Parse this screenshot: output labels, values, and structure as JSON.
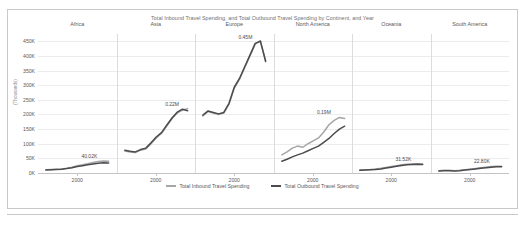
{
  "chart_data": {
    "type": "line",
    "title": "Total Inbound Travel Spending, and Total Outbound Travel Spending by Continent, and Year",
    "xlabel": "",
    "ylabel": "(Thousands)",
    "ylim": [
      0,
      475
    ],
    "yticks": [
      "0K",
      "50K",
      "100K",
      "150K",
      "200K",
      "250K",
      "300K",
      "350K",
      "400K",
      "450K"
    ],
    "ytick_values": [
      0,
      50,
      100,
      150,
      200,
      250,
      300,
      350,
      400,
      450
    ],
    "grid": true,
    "legend_position": "bottom",
    "facet_by": "Continent",
    "x_tick_label": "2000",
    "legend": [
      {
        "name": "Total Inbound Travel Spending",
        "color": "#a6a6a9"
      },
      {
        "name": "Total Outbound Travel Spending",
        "color": "#4c4c4f"
      }
    ],
    "panels": [
      {
        "name": "Africa",
        "data_label": "40.02K",
        "x": [
          1995,
          1997,
          1999,
          2001,
          2003,
          2005,
          2007,
          2009,
          2011,
          2013,
          2015,
          2017,
          2019
        ],
        "series": [
          {
            "name": "Total Inbound Travel Spending",
            "values": [
              11,
              12,
              13,
              14,
              16,
              20,
              25,
              28,
              32,
              36,
              39,
              41,
              40
            ]
          },
          {
            "name": "Total Outbound Travel Spending",
            "values": [
              10,
              11,
              12,
              13,
              15,
              18,
              22,
              25,
              28,
              31,
              33,
              35,
              34
            ]
          }
        ]
      },
      {
        "name": "Asia",
        "data_label": "0.22M",
        "x": [
          1995,
          1997,
          1999,
          2001,
          2003,
          2005,
          2007,
          2009,
          2011,
          2013,
          2015,
          2017,
          2019
        ],
        "series": [
          {
            "name": "Total Inbound Travel Spending",
            "values": [
              75,
              72,
              70,
              78,
              82,
              100,
              120,
              135,
              160,
              185,
              205,
              215,
              220
            ]
          },
          {
            "name": "Total Outbound Travel Spending",
            "values": [
              78,
              74,
              72,
              80,
              85,
              103,
              123,
              138,
              163,
              188,
              208,
              218,
              213
            ]
          }
        ]
      },
      {
        "name": "Europe",
        "data_label": "0.45M",
        "x": [
          1995,
          1997,
          1999,
          2001,
          2003,
          2005,
          2007,
          2009,
          2011,
          2013,
          2015,
          2017,
          2019
        ],
        "series": [
          {
            "name": "Total Inbound Travel Spending",
            "values": [
              195,
              210,
              205,
              200,
              205,
              235,
              290,
              320,
              360,
              400,
              440,
              452,
              380
            ]
          },
          {
            "name": "Total Outbound Travel Spending",
            "values": [
              198,
              212,
              207,
              202,
              207,
              238,
              293,
              323,
              363,
              403,
              443,
              450,
              382
            ]
          }
        ]
      },
      {
        "name": "North America",
        "data_label": "0.19M",
        "x": [
          1995,
          1997,
          1999,
          2001,
          2003,
          2005,
          2007,
          2009,
          2011,
          2013,
          2015,
          2017,
          2019
        ],
        "series": [
          {
            "name": "Total Inbound Travel Spending",
            "values": [
              62,
              72,
              85,
              92,
              88,
              100,
              110,
              120,
              140,
              165,
              180,
              190,
              186
            ]
          },
          {
            "name": "Total Outbound Travel Spending",
            "values": [
              40,
              47,
              55,
              62,
              68,
              76,
              84,
              92,
              105,
              118,
              135,
              150,
              160
            ]
          }
        ]
      },
      {
        "name": "Oceania",
        "data_label": "31.52K",
        "x": [
          1995,
          1997,
          1999,
          2001,
          2003,
          2005,
          2007,
          2009,
          2011,
          2013,
          2015,
          2017,
          2019
        ],
        "series": [
          {
            "name": "Total Inbound Travel Spending",
            "values": [
              10,
              11,
              12,
              14,
              16,
              19,
              22,
              25,
              28,
              30,
              31,
              32,
              31
            ]
          },
          {
            "name": "Total Outbound Travel Spending",
            "values": [
              9,
              10,
              11,
              12,
              14,
              17,
              20,
              23,
              26,
              28,
              29,
              30,
              29
            ]
          }
        ]
      },
      {
        "name": "South America",
        "data_label": "22.80K",
        "x": [
          1995,
          1997,
          1999,
          2001,
          2003,
          2005,
          2007,
          2009,
          2011,
          2013,
          2015,
          2017,
          2019
        ],
        "series": [
          {
            "name": "Total Inbound Travel Spending",
            "values": [
              8,
              9,
              9,
              8,
              9,
              11,
              13,
              15,
              18,
              20,
              22,
              23,
              23
            ]
          },
          {
            "name": "Total Outbound Travel Spending",
            "values": [
              7,
              8,
              8,
              7,
              8,
              10,
              12,
              14,
              16,
              18,
              20,
              21,
              21
            ]
          }
        ]
      }
    ]
  }
}
